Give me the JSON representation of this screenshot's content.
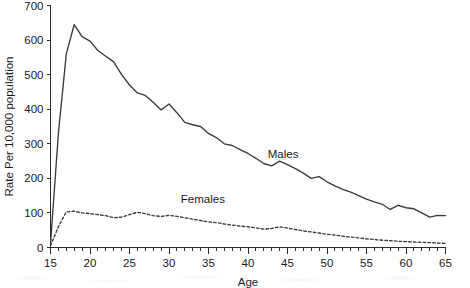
{
  "chart_data": {
    "type": "line",
    "title": "",
    "xlabel": "Age",
    "ylabel": "Rate Per 10,000 population",
    "xlim": [
      15,
      65
    ],
    "ylim": [
      0,
      700
    ],
    "ytick_step": 100,
    "xtick_step": 5,
    "xminor_step": 1,
    "grid": false,
    "legend_position": "inline-annotations",
    "x": [
      15,
      16,
      17,
      18,
      19,
      20,
      21,
      22,
      23,
      24,
      25,
      26,
      27,
      28,
      29,
      30,
      31,
      32,
      33,
      34,
      35,
      36,
      37,
      38,
      39,
      40,
      41,
      42,
      43,
      44,
      45,
      46,
      47,
      48,
      49,
      50,
      51,
      52,
      53,
      54,
      55,
      56,
      57,
      58,
      59,
      60,
      61,
      62,
      63,
      64,
      65
    ],
    "yticks": [
      0,
      100,
      200,
      300,
      400,
      500,
      600,
      700
    ],
    "xticks": [
      15,
      20,
      25,
      30,
      35,
      40,
      45,
      50,
      55,
      60,
      65
    ],
    "series": [
      {
        "name": "Males",
        "style": "solid",
        "label_x": 42.5,
        "label_y": 260,
        "values": [
          10,
          330,
          560,
          645,
          610,
          597,
          570,
          553,
          537,
          500,
          470,
          447,
          440,
          420,
          398,
          415,
          390,
          362,
          355,
          350,
          330,
          318,
          300,
          295,
          283,
          272,
          258,
          243,
          236,
          250,
          240,
          228,
          215,
          200,
          205,
          190,
          178,
          168,
          160,
          150,
          140,
          132,
          125,
          110,
          122,
          115,
          112,
          100,
          88,
          93,
          92
        ]
      },
      {
        "name": "Females",
        "style": "dashed",
        "label_x": 31.5,
        "label_y": 128,
        "values": [
          5,
          60,
          103,
          105,
          100,
          98,
          95,
          92,
          86,
          88,
          95,
          102,
          98,
          92,
          90,
          93,
          90,
          86,
          82,
          78,
          74,
          72,
          68,
          65,
          62,
          60,
          57,
          53,
          55,
          60,
          56,
          52,
          48,
          45,
          42,
          38,
          36,
          33,
          30,
          28,
          25,
          23,
          21,
          20,
          18,
          17,
          16,
          15,
          14,
          13,
          12
        ]
      }
    ]
  },
  "axis": {
    "y_title": "Rate Per 10,000 population",
    "x_title": "Age"
  }
}
